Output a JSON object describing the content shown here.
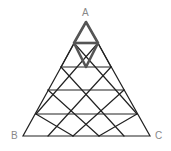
{
  "diagram": {
    "type": "triangular-grid",
    "rows": 5,
    "labels": {
      "apex": "A",
      "bottom_left": "B",
      "bottom_right": "C"
    },
    "highlight": {
      "description": "rhombus formed by top two small triangles",
      "stroke": "#555555"
    },
    "colors": {
      "line": "#222222",
      "label": "#888888",
      "background": "#ffffff"
    }
  }
}
